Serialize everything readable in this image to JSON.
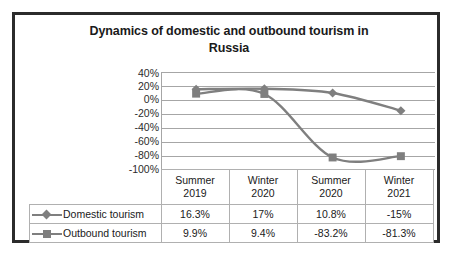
{
  "chart_data": {
    "type": "line",
    "title": "Dynamics of domestic and outbound tourism in Russia",
    "title_line1": "Dynamics of domestic and outbound tourism in",
    "title_line2": "Russia",
    "categories": [
      "Summer 2019",
      "Winter 2020",
      "Summer 2020",
      "Winter 2021"
    ],
    "category_lines": [
      {
        "top": "Summer",
        "bottom": "2019"
      },
      {
        "top": "Winter",
        "bottom": "2020"
      },
      {
        "top": "Summer",
        "bottom": "2020"
      },
      {
        "top": "Winter",
        "bottom": "2021"
      }
    ],
    "series": [
      {
        "name": "Domestic tourism",
        "marker": "diamond",
        "color": "#7f7f7f",
        "values": [
          16.3,
          17,
          10.8,
          -15
        ],
        "labels": [
          "16.3%",
          "17%",
          "10.8%",
          "-15%"
        ]
      },
      {
        "name": "Outbound tourism",
        "marker": "square",
        "color": "#7f7f7f",
        "values": [
          9.9,
          9.4,
          -83.2,
          -81.3
        ],
        "labels": [
          "9.9%",
          "9.4%",
          "-83.2%",
          "-81.3%"
        ]
      }
    ],
    "ylabel": "",
    "xlabel": "",
    "ylim": [
      -100,
      40
    ],
    "ytick_labels": [
      "40%",
      "20%",
      "0%",
      "-20%",
      "-40%",
      "-60%",
      "-80%",
      "-100%"
    ],
    "ytick_values": [
      40,
      20,
      0,
      -20,
      -40,
      -60,
      -80,
      -100
    ],
    "grid": true,
    "legend_position": "data-table-left",
    "smooth_lines": true,
    "data_table_visible": true
  },
  "colors": {
    "frame_border": "#2b2b2b",
    "gridline": "#a6a6a6",
    "series_gray": "#7f7f7f",
    "table_border": "#b0b0b0",
    "text": "#1a1a1a",
    "background": "#ffffff"
  }
}
